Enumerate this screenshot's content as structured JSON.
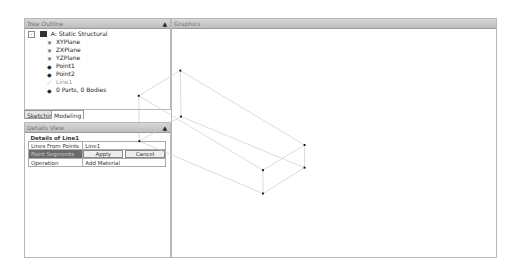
{
  "tree_outline": {
    "title": "Tree Outline",
    "root": "A: Static Structural",
    "items": [
      {
        "label": "XYPlane",
        "icon": "plane-icon"
      },
      {
        "label": "ZXPlane",
        "icon": "plane-icon"
      },
      {
        "label": "YZPlane",
        "icon": "plane-icon"
      },
      {
        "label": "Point1",
        "icon": "point-feature-icon"
      },
      {
        "label": "Point2",
        "icon": "point-feature-icon"
      },
      {
        "label": "Line1",
        "icon": "line-feature-icon"
      },
      {
        "label": "0 Parts, 0 Bodies",
        "icon": "parts-icon"
      }
    ]
  },
  "tabs": {
    "sketching": "Sketching",
    "modeling": "Modeling"
  },
  "details_view": {
    "title": "Details View",
    "group": "Details of Line1",
    "rows": [
      {
        "label": "Lines From Points",
        "value": "Line1"
      },
      {
        "label": "Point Segments",
        "apply": "Apply",
        "cancel": "Cancel"
      },
      {
        "label": "Operation",
        "value": "Add Material"
      }
    ]
  },
  "graphics": {
    "title": "Graphics"
  }
}
